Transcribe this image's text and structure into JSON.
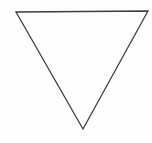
{
  "canvas": {
    "width": 152,
    "height": 143,
    "background_color": "#fdfdfd",
    "label": "drawing-canvas"
  },
  "figure": {
    "name": "downward-pointing-triangle",
    "shape_type": "triangle",
    "orientation": "point-down",
    "fill": "none",
    "stroke_color": "#3d3d3d",
    "stroke_width": 1.3,
    "stroke_linejoin": "miter",
    "vertices": [
      {
        "label": "top-left-vertex",
        "x": 16,
        "y": 12
      },
      {
        "label": "top-right-vertex",
        "x": 148,
        "y": 11
      },
      {
        "label": "bottom-apex-vertex",
        "x": 83,
        "y": 129
      }
    ],
    "points_attr": "16,12 148,11 83,129",
    "edges": [
      {
        "label": "top-edge",
        "from": "top-left-vertex",
        "to": "top-right-vertex"
      },
      {
        "label": "right-edge",
        "from": "top-right-vertex",
        "to": "bottom-apex-vertex"
      },
      {
        "label": "left-edge",
        "from": "bottom-apex-vertex",
        "to": "top-left-vertex"
      }
    ]
  }
}
